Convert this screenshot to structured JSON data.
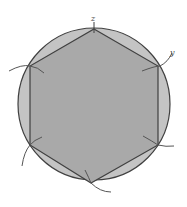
{
  "diagram": {
    "colors": {
      "circle_fill": "#c4c4c4",
      "hexagon_fill": "#a9a9a9",
      "stroke": "#404040",
      "arc": "#555555",
      "background": "#ffffff"
    },
    "circle": {
      "cx": 94,
      "cy": 104,
      "r": 76
    },
    "vertices": [
      {
        "name": "top",
        "x": 94,
        "y": 29
      },
      {
        "name": "upper-right",
        "x": 158,
        "y": 66
      },
      {
        "name": "lower-right",
        "x": 158,
        "y": 145
      },
      {
        "name": "bottom",
        "x": 91,
        "y": 183
      },
      {
        "name": "lower-left",
        "x": 30,
        "y": 145
      },
      {
        "name": "upper-left",
        "x": 30,
        "y": 66
      }
    ],
    "labels": [
      {
        "text": "z",
        "x": 91,
        "y": 22
      },
      {
        "text": "y",
        "x": 170,
        "y": 56
      }
    ]
  }
}
